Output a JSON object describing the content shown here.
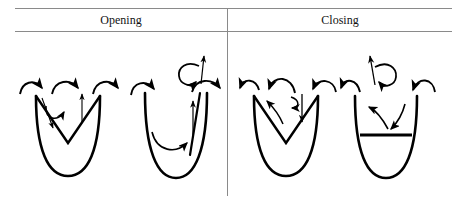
{
  "figure": {
    "kind": "diagram",
    "background_color": "#ffffff",
    "stroke_color": "#000000",
    "rule_color": "#8a8a8a"
  },
  "table": {
    "columns": [
      {
        "id": "opening",
        "label": "Opening"
      },
      {
        "id": "closing",
        "label": "Closing"
      }
    ],
    "rule_top_y": 8,
    "rule_bottom_y": 31,
    "divider_x": 227
  },
  "panels": [
    {
      "id": "panel-1",
      "column": "opening",
      "name": "opening-panel-left",
      "well": "parabola",
      "inner_shape": "v-chevron",
      "arcs": [
        {
          "name": "arc-outward-left",
          "direction": "right"
        },
        {
          "name": "arc-outward-middle",
          "direction": "right"
        },
        {
          "name": "arc-outward-right",
          "direction": "right"
        }
      ],
      "inner_arrows": [
        {
          "name": "arrow-down-left-wall",
          "direction": "down"
        },
        {
          "name": "arrow-curl-center",
          "direction": "clockwise"
        },
        {
          "name": "arrow-up-right-center",
          "direction": "up"
        }
      ]
    },
    {
      "id": "panel-2",
      "column": "opening",
      "name": "opening-panel-right",
      "well": "parabola",
      "inner_shape": "parallel-line-right-wall",
      "arcs": [
        {
          "name": "arc-outward-left",
          "direction": "right"
        },
        {
          "name": "arc-outward-right",
          "direction": "right"
        },
        {
          "name": "arc-interior-sweep",
          "direction": "right"
        }
      ],
      "inner_arrows": [
        {
          "name": "arrow-up-interior",
          "direction": "up"
        },
        {
          "name": "arrow-circular-top",
          "direction": "clockwise"
        },
        {
          "name": "arrow-up-top",
          "direction": "up"
        }
      ]
    },
    {
      "id": "panel-3",
      "column": "closing",
      "name": "closing-panel-left",
      "well": "parabola",
      "inner_shape": "v-chevron",
      "arcs": [
        {
          "name": "arc-inward-left",
          "direction": "left"
        },
        {
          "name": "arc-inward-middle",
          "direction": "left"
        },
        {
          "name": "arc-inward-right",
          "direction": "left"
        }
      ],
      "inner_arrows": [
        {
          "name": "arrow-up-left-interior",
          "direction": "up-left"
        },
        {
          "name": "arrow-curl-center",
          "direction": "counterclockwise"
        },
        {
          "name": "arrow-down-right-center",
          "direction": "down"
        }
      ]
    },
    {
      "id": "panel-4",
      "column": "closing",
      "name": "closing-panel-right",
      "well": "parabola",
      "inner_shape": "horizontal-bar",
      "arcs": [
        {
          "name": "arc-inward-left",
          "direction": "left"
        },
        {
          "name": "arc-inward-right",
          "direction": "left"
        },
        {
          "name": "arc-interior-converge-left",
          "direction": "left"
        },
        {
          "name": "arc-interior-converge-right",
          "direction": "down-left"
        }
      ],
      "inner_arrows": [
        {
          "name": "arrow-circular-top",
          "direction": "counterclockwise"
        },
        {
          "name": "arrow-up-top",
          "direction": "up"
        }
      ]
    }
  ]
}
